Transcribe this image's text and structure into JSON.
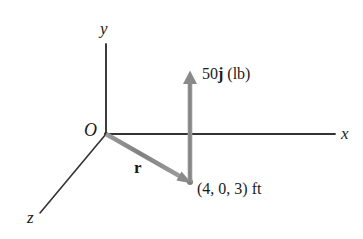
{
  "figure": {
    "background_color": "#ffffff",
    "axis_color": "#333333",
    "vector_color": "#8a8a8a",
    "text_color": "#1a1a1a"
  },
  "axes": {
    "x": {
      "label": "x",
      "from": [
        106,
        134
      ],
      "to": [
        335,
        134
      ]
    },
    "y": {
      "label": "y",
      "from": [
        106,
        134
      ],
      "to": [
        106,
        44
      ]
    },
    "z": {
      "label": "z",
      "from": [
        106,
        134
      ],
      "to": [
        40,
        213
      ]
    }
  },
  "origin": {
    "label": "O",
    "position": [
      106,
      134
    ]
  },
  "vectors": [
    {
      "name": "position-vector",
      "label": "r",
      "label_style": "bold",
      "color": "#8a8a8a",
      "from": [
        106,
        134
      ],
      "to": [
        190,
        182
      ]
    },
    {
      "name": "force-vector",
      "label_parts": [
        {
          "text": "50",
          "bold": false
        },
        {
          "text": "j",
          "bold": true
        },
        {
          "text": " (lb)",
          "bold": false
        }
      ],
      "label_text": "50j (lb)",
      "magnitude": 50,
      "direction": "j",
      "units": "lb",
      "color": "#8a8a8a",
      "from": [
        190,
        182
      ],
      "to": [
        190,
        71
      ]
    }
  ],
  "points": [
    {
      "name": "application-point",
      "label": "(4, 0, 3) ft",
      "coordinates": [
        4,
        0,
        3
      ],
      "units": "ft",
      "position": [
        190,
        182
      ]
    }
  ]
}
